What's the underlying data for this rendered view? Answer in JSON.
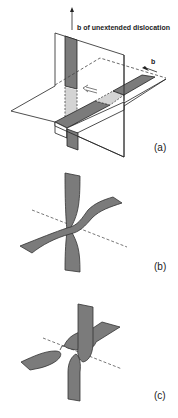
{
  "figure": {
    "panels": [
      {
        "id": "a",
        "label": "(a)",
        "annotations": {
          "burgers_unextended": "b of unextended dislocation",
          "burgers": "b"
        }
      },
      {
        "id": "b",
        "label": "(b)"
      },
      {
        "id": "c",
        "label": "(c)"
      }
    ],
    "colors": {
      "ribbon_dark": "#7b7b7b",
      "ribbon_light": "#d4d4d4",
      "line": "#222222",
      "dashed": "#555555"
    }
  }
}
